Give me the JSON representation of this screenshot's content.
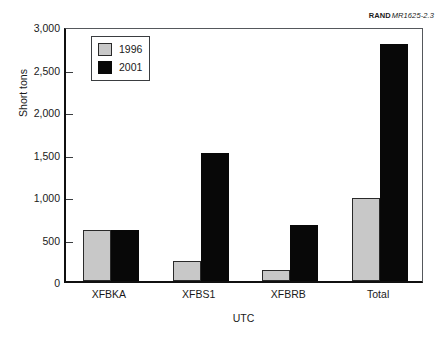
{
  "figure_credit": {
    "brand": "RAND",
    "code": "MR1625-2.3"
  },
  "chart_data": {
    "type": "bar",
    "title": "",
    "subtitle": "",
    "xlabel": "UTC",
    "ylabel": "Short tons",
    "categories": [
      "XFBKA",
      "XFBS1",
      "XFBRB",
      "Total"
    ],
    "series": [
      {
        "name": "1996",
        "color": "#c8c8c8",
        "values": [
          600,
          240,
          130,
          975
        ]
      },
      {
        "name": "2001",
        "color": "#080808",
        "values": [
          600,
          1510,
          660,
          2785
        ]
      }
    ],
    "ylim": [
      0,
      3000
    ],
    "ytick_values": [
      0,
      500,
      1000,
      1500,
      2000,
      2500,
      3000
    ],
    "ytick_labels": [
      "0",
      "500",
      "1,000",
      "1,500",
      "2,000",
      "2,500",
      "3,000"
    ],
    "grid": false,
    "legend_position": "upper-left",
    "legend_entries": [
      "1996",
      "2001"
    ]
  }
}
